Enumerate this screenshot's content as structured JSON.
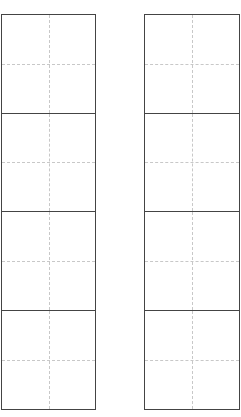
{
  "worksheet": {
    "type": "tian-zi-ge practice grid",
    "columns": [
      {
        "id": "left",
        "cells": 4
      },
      {
        "id": "right",
        "cells": 4
      }
    ],
    "colors": {
      "border": "#444444",
      "guide": "#c8c8c8",
      "background": "#ffffff"
    }
  }
}
